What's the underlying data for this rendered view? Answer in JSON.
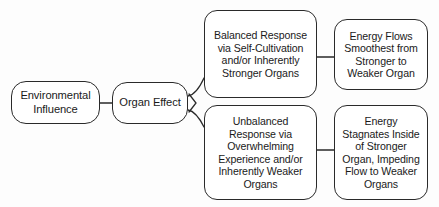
{
  "diagram": {
    "type": "flowchart",
    "orientation": "left-to-right",
    "background_color": "#fdfdfd",
    "line_color": "#2a2a2a",
    "text_color": "#1a1a1a",
    "nodes": {
      "environmental_influence": {
        "label": "Environmental\nInfluence",
        "shape": "rounded-rectangle"
      },
      "organ_effect": {
        "label": "Organ Effect",
        "shape": "rounded-rectangle"
      },
      "balanced_response": {
        "label": "Balanced Response\nvia Self-Cultivation\nand/or Inherently\nStronger Organs",
        "shape": "rounded-rectangle"
      },
      "energy_flows": {
        "label": "Energy Flows\nSmoothest from\nStronger to\nWeaker Organ",
        "shape": "rounded-rectangle"
      },
      "unbalanced_response": {
        "label": "Unbalanced\nResponse via\nOverwhelming\nExperience and/or\nInherently Weaker\nOrgans",
        "shape": "rounded-rectangle"
      },
      "energy_stagnates": {
        "label": "Energy\nStagnates Inside\nof Stronger\nOrgan, Impeding\nFlow to Weaker\nOrgans",
        "shape": "rounded-rectangle"
      }
    },
    "edges": [
      {
        "from": "environmental_influence",
        "to": "organ_effect",
        "style": "straight"
      },
      {
        "from": "organ_effect",
        "to": "balanced_response",
        "style": "branch-up"
      },
      {
        "from": "organ_effect",
        "to": "unbalanced_response",
        "style": "branch-down"
      },
      {
        "from": "balanced_response",
        "to": "energy_flows",
        "style": "straight"
      },
      {
        "from": "unbalanced_response",
        "to": "energy_stagnates",
        "style": "straight"
      }
    ]
  }
}
